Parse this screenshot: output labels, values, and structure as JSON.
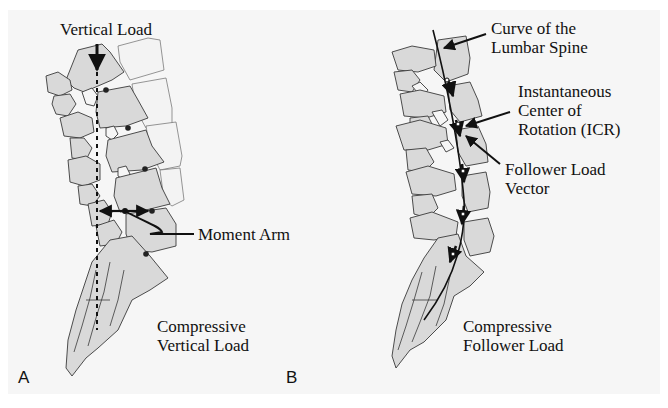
{
  "figure": {
    "background_color": "#f6f6f6",
    "bone_fill_color": "#d9d9d9",
    "outline_color": "#3a3a3a",
    "arrow_color": "#111111"
  },
  "panel_a": {
    "letter": "A",
    "labels": {
      "vertical_load": "Vertical Load",
      "moment_arm": "Moment Arm",
      "bottom_line1": "Compressive",
      "bottom_line2": "Vertical Load"
    }
  },
  "panel_b": {
    "letter": "B",
    "labels": {
      "curve_line1": "Curve of the",
      "curve_line2": "Lumbar Spine",
      "icr_line1": "Instantaneous",
      "icr_line2": "Center of",
      "icr_line3": "Rotation (ICR)",
      "follower_line1": "Follower Load",
      "follower_line2": "Vector",
      "bottom_line1": "Compressive",
      "bottom_line2": "Follower Load"
    }
  }
}
